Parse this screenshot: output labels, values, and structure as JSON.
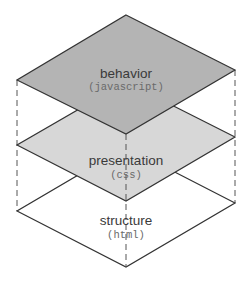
{
  "diagram": {
    "title": "",
    "layers": [
      {
        "id": "structure",
        "name": "structure",
        "tech": "(html)",
        "fill": "#ffffff",
        "points": "126,147 235,203 126,267 17,211",
        "label_y": 225,
        "tech_y": 238
      },
      {
        "id": "presentation",
        "name": "presentation",
        "tech": "(css)",
        "fill": "#d7d7d7",
        "points": "126,82 235,137 126,201 17,145",
        "label_y": 165,
        "tech_y": 178
      },
      {
        "id": "behavior",
        "name": "behavior",
        "tech": "(javascript)",
        "fill": "#b4b4b4",
        "points": "126,15 235,70 126,134 17,80",
        "label_y": 78,
        "tech_y": 90
      }
    ],
    "colors": {
      "outline": "#333333",
      "dash": "#555555"
    }
  }
}
